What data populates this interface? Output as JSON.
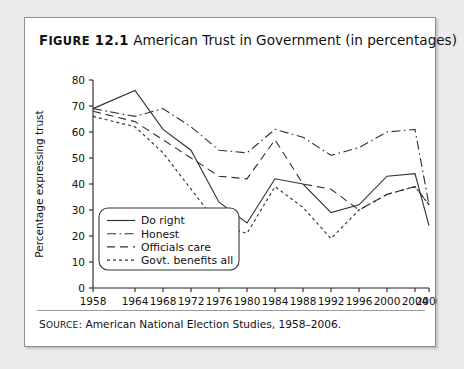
{
  "figure": {
    "number_label": "FIGURE 12.1",
    "number_prefix": "F",
    "number_rest": "IGURE",
    "number_value": " 12.1",
    "title": "American Trust in Government (in percentages)",
    "source_label": "SOURCE:",
    "source_label_prefix": "S",
    "source_label_rest": "OURCE",
    "source_text": "American National Election Studies, 1958–2006."
  },
  "chart_data": {
    "type": "line",
    "title": "American Trust in Government (in percentages)",
    "xlabel": "",
    "ylabel": "Percentage expressing trust",
    "x": [
      1958,
      1964,
      1968,
      1972,
      1976,
      1980,
      1984,
      1988,
      1992,
      1996,
      2000,
      2004,
      2006
    ],
    "xlim": [
      1958,
      2006
    ],
    "ylim": [
      0,
      80
    ],
    "yticks": [
      0,
      10,
      20,
      30,
      40,
      50,
      60,
      70,
      80
    ],
    "xticks": [
      "1958",
      "1964",
      "1968",
      "1972",
      "1976",
      "1980",
      "1984",
      "1988",
      "1992",
      "1996",
      "2000",
      "2004",
      "2006"
    ],
    "grid": false,
    "legend_position": "lower-left-inside",
    "series": [
      {
        "name": "Do right",
        "style": "solid",
        "values": [
          69,
          76,
          61,
          53,
          33,
          25,
          42,
          40,
          29,
          32,
          43,
          44,
          24
        ]
      },
      {
        "name": "Honest",
        "style": "dash-dot",
        "values": [
          69,
          66,
          69,
          62,
          53,
          52,
          61,
          58,
          51,
          54,
          60,
          61,
          32
        ]
      },
      {
        "name": "Officials care",
        "style": "dashed",
        "values": [
          68,
          64,
          57,
          50,
          43,
          42,
          57,
          40,
          38,
          30,
          36,
          39,
          32
        ]
      },
      {
        "name": "Govt. benefits all",
        "style": "dotted",
        "values": [
          66,
          62,
          52,
          38,
          24,
          21,
          39,
          31,
          19,
          30,
          36,
          39,
          32
        ]
      }
    ]
  },
  "legend": {
    "items": [
      {
        "label": "Do right",
        "style": "solid"
      },
      {
        "label": "Honest",
        "style": "dash-dot"
      },
      {
        "label": "Officials care",
        "style": "dashed"
      },
      {
        "label": "Govt. benefits all",
        "style": "dotted"
      }
    ]
  }
}
